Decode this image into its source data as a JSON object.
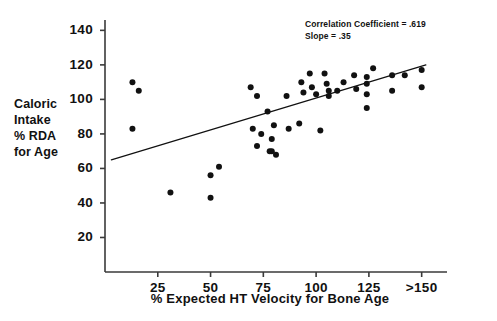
{
  "chart_data": {
    "type": "scatter",
    "title": "",
    "xlabel": "% Expected HT Velocity for Bone Age",
    "ylabel": "Caloric Intake % RDA for Age",
    "ylabel_lines": [
      "Caloric",
      "Intake",
      "% RDA",
      "for Age"
    ],
    "xlim": [
      0,
      162
    ],
    "ylim": [
      0,
      146
    ],
    "grid": false,
    "legend": null,
    "xticks": [
      25,
      50,
      75,
      100,
      125,
      150
    ],
    "xticklabels": [
      "25",
      "50",
      "75",
      "100",
      "125",
      ">150"
    ],
    "yticks": [
      20,
      40,
      60,
      80,
      100,
      120,
      140
    ],
    "yticklabels": [
      "20",
      "40",
      "60",
      "80",
      "100",
      "120",
      "140"
    ],
    "annotations": [
      "Correlation Coefficient  =  .619",
      "Slope  =  .35"
    ],
    "correlation_coefficient": 0.619,
    "slope": 0.35,
    "marker": "filled-circle",
    "marker_color": "#111111",
    "marker_size_px": 6,
    "trendline": {
      "type": "linear-fit",
      "x_start": 3,
      "y_start": 65,
      "x_end": 152,
      "y_end": 120,
      "color": "#111111",
      "width_px": 1.2
    },
    "points": [
      {
        "x": 13,
        "y": 110
      },
      {
        "x": 16,
        "y": 105
      },
      {
        "x": 13,
        "y": 83
      },
      {
        "x": 31,
        "y": 46
      },
      {
        "x": 50,
        "y": 56
      },
      {
        "x": 50,
        "y": 43
      },
      {
        "x": 54,
        "y": 61
      },
      {
        "x": 69,
        "y": 107
      },
      {
        "x": 70,
        "y": 83
      },
      {
        "x": 72,
        "y": 102
      },
      {
        "x": 72,
        "y": 73
      },
      {
        "x": 74,
        "y": 80
      },
      {
        "x": 77,
        "y": 93
      },
      {
        "x": 78,
        "y": 70
      },
      {
        "x": 79,
        "y": 70
      },
      {
        "x": 79,
        "y": 77
      },
      {
        "x": 80,
        "y": 85
      },
      {
        "x": 81,
        "y": 68
      },
      {
        "x": 86,
        "y": 102
      },
      {
        "x": 87,
        "y": 83
      },
      {
        "x": 92,
        "y": 86
      },
      {
        "x": 93,
        "y": 110
      },
      {
        "x": 94,
        "y": 104
      },
      {
        "x": 97,
        "y": 115
      },
      {
        "x": 98,
        "y": 107
      },
      {
        "x": 100,
        "y": 103
      },
      {
        "x": 102,
        "y": 82
      },
      {
        "x": 104,
        "y": 115
      },
      {
        "x": 105,
        "y": 109
      },
      {
        "x": 106,
        "y": 105
      },
      {
        "x": 106,
        "y": 102
      },
      {
        "x": 110,
        "y": 105
      },
      {
        "x": 113,
        "y": 110
      },
      {
        "x": 118,
        "y": 114
      },
      {
        "x": 119,
        "y": 106
      },
      {
        "x": 124,
        "y": 113
      },
      {
        "x": 124,
        "y": 109
      },
      {
        "x": 124,
        "y": 103
      },
      {
        "x": 124,
        "y": 95
      },
      {
        "x": 127,
        "y": 118
      },
      {
        "x": 136,
        "y": 114
      },
      {
        "x": 136,
        "y": 105
      },
      {
        "x": 142,
        "y": 114
      },
      {
        "x": 150,
        "y": 117
      },
      {
        "x": 150,
        "y": 107
      }
    ],
    "axes": {
      "color": "#3a3a3a",
      "left_spine": true,
      "bottom_spine": true,
      "top_spine": false,
      "right_spine": false,
      "tick_direction": "out"
    }
  }
}
